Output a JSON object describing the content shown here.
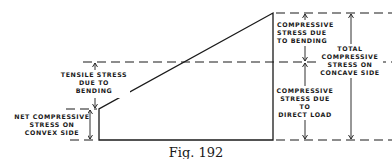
{
  "figure": {
    "caption": "Fig. 192",
    "labels": {
      "tensile": [
        "TENSILE STRESS",
        "DUE TO",
        "BENDING"
      ],
      "net_compressive": [
        "NET COMPRESSIVE",
        "STRESS ON",
        "CONVEX SIDE"
      ],
      "compressive_bending": [
        "COMPRESSIVE",
        "STRESS DUE",
        "TO BENDING"
      ],
      "total_compressive": [
        "TOTAL",
        "COMPRESSIVE",
        "STRESS ON",
        "CONCAVE SIDE"
      ],
      "compressive_direct": [
        "COMPRESSIVE",
        "STRESS DUE",
        "TO",
        "DIRECT LOAD"
      ]
    }
  }
}
